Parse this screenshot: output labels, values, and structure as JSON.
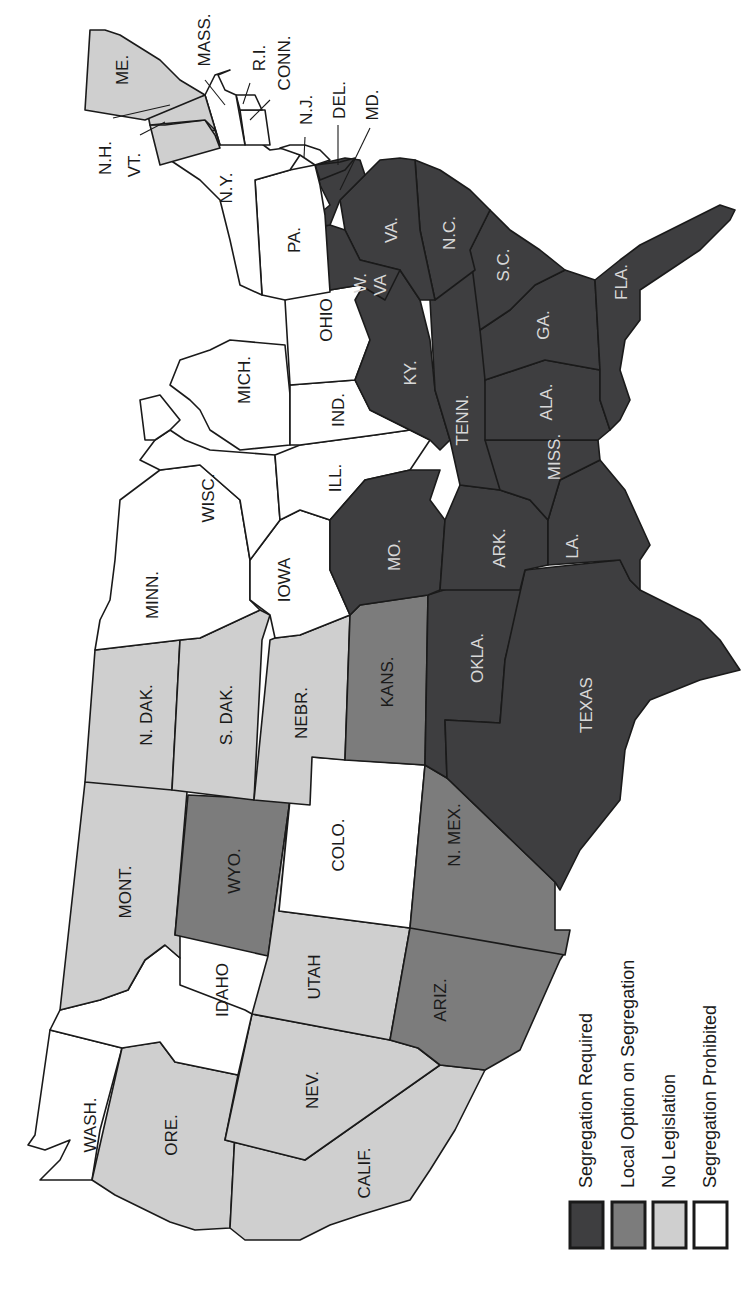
{
  "map": {
    "orientation": "rotated -90 degrees (north points left)",
    "categories": {
      "required": {
        "label": "Segregation Required",
        "color": "#3e3e40"
      },
      "local": {
        "label": "Local Option on Segregation",
        "color": "#7c7c7c"
      },
      "none": {
        "label": "No Legislation",
        "color": "#cfcfcf"
      },
      "prohibited": {
        "label": "Segregation Prohibited",
        "color": "#ffffff"
      }
    },
    "states": [
      {
        "abbr": "WASH.",
        "category": "prohibited"
      },
      {
        "abbr": "ORE.",
        "category": "none"
      },
      {
        "abbr": "CALIF.",
        "category": "none"
      },
      {
        "abbr": "IDAHO",
        "category": "prohibited"
      },
      {
        "abbr": "NEV.",
        "category": "none"
      },
      {
        "abbr": "MONT.",
        "category": "none"
      },
      {
        "abbr": "WYO.",
        "category": "local"
      },
      {
        "abbr": "UTAH",
        "category": "none"
      },
      {
        "abbr": "ARIZ.",
        "category": "local"
      },
      {
        "abbr": "COLO.",
        "category": "prohibited"
      },
      {
        "abbr": "N. MEX.",
        "category": "local"
      },
      {
        "abbr": "N. DAK.",
        "category": "none"
      },
      {
        "abbr": "S. DAK.",
        "category": "none"
      },
      {
        "abbr": "NEBR.",
        "category": "none"
      },
      {
        "abbr": "KANS.",
        "category": "local"
      },
      {
        "abbr": "OKLA.",
        "category": "required"
      },
      {
        "abbr": "TEXAS",
        "category": "required"
      },
      {
        "abbr": "MINN.",
        "category": "prohibited"
      },
      {
        "abbr": "IOWA",
        "category": "prohibited"
      },
      {
        "abbr": "MO.",
        "category": "required"
      },
      {
        "abbr": "ARK.",
        "category": "required"
      },
      {
        "abbr": "LA.",
        "category": "required"
      },
      {
        "abbr": "WISC.",
        "category": "prohibited"
      },
      {
        "abbr": "ILL.",
        "category": "prohibited"
      },
      {
        "abbr": "MICH.",
        "category": "prohibited"
      },
      {
        "abbr": "IND.",
        "category": "prohibited"
      },
      {
        "abbr": "OHIO",
        "category": "prohibited"
      },
      {
        "abbr": "KY.",
        "category": "required"
      },
      {
        "abbr": "TENN.",
        "category": "required"
      },
      {
        "abbr": "MISS.",
        "category": "required"
      },
      {
        "abbr": "ALA.",
        "category": "required"
      },
      {
        "abbr": "GA.",
        "category": "required"
      },
      {
        "abbr": "FLA.",
        "category": "required"
      },
      {
        "abbr": "S.C.",
        "category": "required"
      },
      {
        "abbr": "N.C.",
        "category": "required"
      },
      {
        "abbr": "VA.",
        "category": "required"
      },
      {
        "abbr": "W. VA",
        "category": "required"
      },
      {
        "abbr": "MD.",
        "category": "required"
      },
      {
        "abbr": "DEL.",
        "category": "required"
      },
      {
        "abbr": "PA.",
        "category": "prohibited"
      },
      {
        "abbr": "N.Y.",
        "category": "prohibited"
      },
      {
        "abbr": "N.J.",
        "category": "prohibited"
      },
      {
        "abbr": "CONN.",
        "category": "prohibited"
      },
      {
        "abbr": "R.I.",
        "category": "prohibited"
      },
      {
        "abbr": "MASS.",
        "category": "prohibited"
      },
      {
        "abbr": "VT.",
        "category": "none"
      },
      {
        "abbr": "N.H.",
        "category": "none"
      },
      {
        "abbr": "ME.",
        "category": "none"
      }
    ],
    "labels": {
      "wash": "WASH.",
      "ore": "ORE.",
      "calif": "CALIF.",
      "idaho": "IDAHO",
      "nev": "NEV.",
      "mont": "MONT.",
      "wyo": "WYO.",
      "utah": "UTAH",
      "ariz": "ARIZ.",
      "colo": "COLO.",
      "nmex": "N. MEX.",
      "ndak": "N. DAK.",
      "sdak": "S. DAK.",
      "nebr": "NEBR.",
      "kans": "KANS.",
      "okla": "OKLA.",
      "texas": "TEXAS",
      "minn": "MINN.",
      "iowa": "IOWA",
      "mo": "MO.",
      "ark": "ARK.",
      "la": "LA.",
      "wisc": "WISC.",
      "ill": "ILL.",
      "mich": "MICH.",
      "ind": "IND.",
      "ohio": "OHIO",
      "ky": "KY.",
      "tenn": "TENN.",
      "miss": "MISS.",
      "ala": "ALA.",
      "ga": "GA.",
      "fla": "FLA.",
      "sc": "S.C.",
      "nc": "N.C.",
      "va": "VA.",
      "wva1": "W.",
      "wva2": "VA",
      "md": "MD.",
      "del": "DEL.",
      "pa": "PA.",
      "ny": "N.Y.",
      "nj": "N.J.",
      "conn": "CONN.",
      "ri": "R.I.",
      "mass": "MASS.",
      "vt": "VT.",
      "nh": "N.H.",
      "me": "ME."
    }
  },
  "legend": {
    "items": [
      {
        "label": "Segregation Required",
        "color": "#3e3e40"
      },
      {
        "label": "Local Option on Segregation",
        "color": "#7c7c7c"
      },
      {
        "label": "No Legislation",
        "color": "#cfcfcf"
      },
      {
        "label": "Segregation Prohibited",
        "color": "#ffffff"
      }
    ]
  }
}
